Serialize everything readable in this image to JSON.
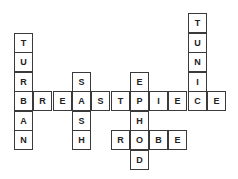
{
  "puzzle": {
    "type": "crossword",
    "origin": {
      "x": 14,
      "y": 91
    },
    "cell_w": 19.3,
    "cell_h": 19.5,
    "words": [
      {
        "word": "BREASTPIECE",
        "direction": "across",
        "col": 0,
        "row": 0
      },
      {
        "word": "ROBE",
        "direction": "across",
        "col": 5,
        "row": 2
      },
      {
        "word": "TURBAN",
        "direction": "down",
        "col": 0,
        "row": -3
      },
      {
        "word": "SASH",
        "direction": "down",
        "col": 3,
        "row": -1
      },
      {
        "word": "EPHOD",
        "direction": "down",
        "col": 6,
        "row": -1
      },
      {
        "word": "TUNIC",
        "direction": "down",
        "col": 9,
        "row": -4
      }
    ]
  }
}
